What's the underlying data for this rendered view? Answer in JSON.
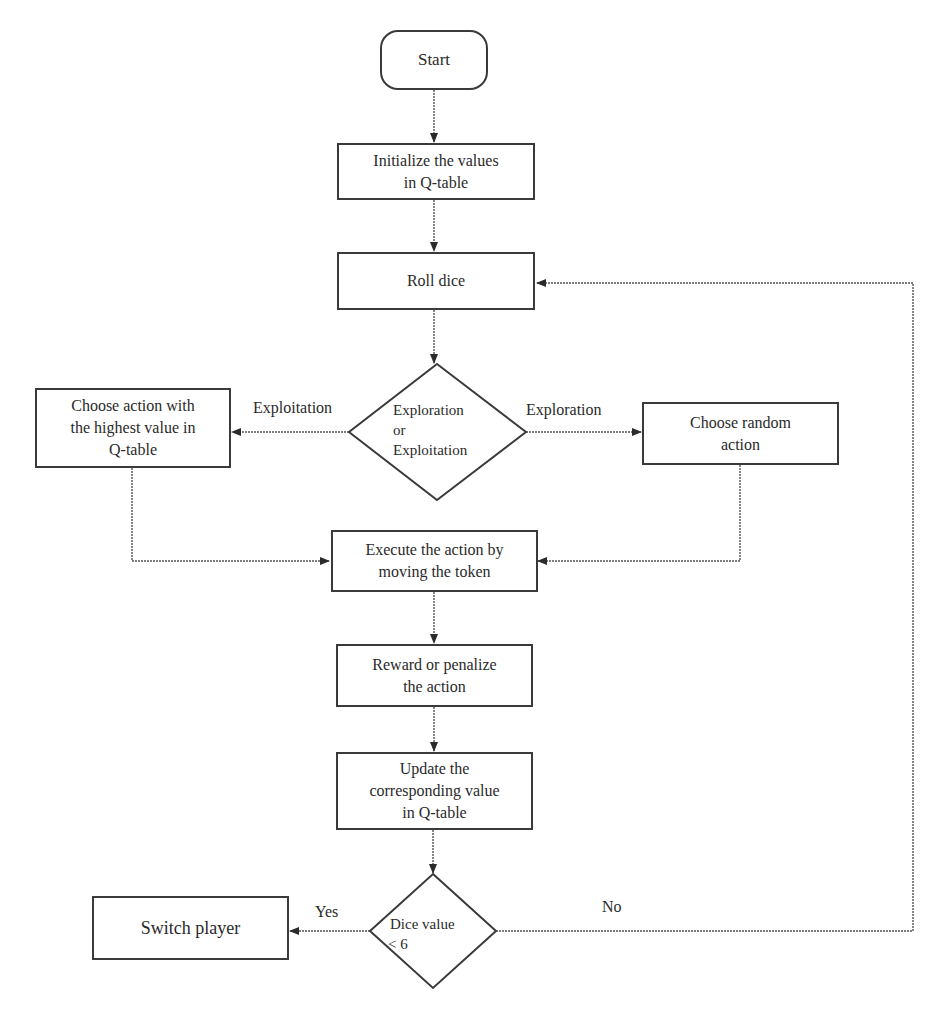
{
  "diagram": {
    "type": "flowchart",
    "nodes": {
      "start": {
        "label": "Start",
        "shape": "terminal"
      },
      "init": {
        "line1": "Initialize  the values",
        "line2": "in Q-table",
        "shape": "process"
      },
      "roll": {
        "label": "Roll dice",
        "shape": "process"
      },
      "decide_explore": {
        "line1": "Exploration",
        "line2": "or",
        "line3": "Exploitation",
        "shape": "decision"
      },
      "exploit_action": {
        "line1": "Choose action with",
        "line2": "the highest value in",
        "line3": "Q-table",
        "shape": "process"
      },
      "random_action": {
        "line1": "Choose random",
        "line2": "action",
        "shape": "process"
      },
      "execute": {
        "line1": "Execute the action by",
        "line2": "moving the token",
        "shape": "process"
      },
      "reward": {
        "line1": "Reward or penalize",
        "line2": "the action",
        "shape": "process"
      },
      "update": {
        "line1": "Update the",
        "line2": "corresponding value",
        "line3": "in Q-table",
        "shape": "process"
      },
      "dice_check": {
        "line1": "Dice value",
        "line2": "< 6",
        "shape": "decision"
      },
      "switch": {
        "label": "Switch player",
        "shape": "process"
      }
    },
    "edge_labels": {
      "exploitation": "Exploitation",
      "exploration": "Exploration",
      "yes": "Yes",
      "no": "No"
    },
    "edges": [
      {
        "from": "start",
        "to": "init"
      },
      {
        "from": "init",
        "to": "roll"
      },
      {
        "from": "roll",
        "to": "decide_explore"
      },
      {
        "from": "decide_explore",
        "to": "exploit_action",
        "label": "Exploitation"
      },
      {
        "from": "decide_explore",
        "to": "random_action",
        "label": "Exploration"
      },
      {
        "from": "exploit_action",
        "to": "execute"
      },
      {
        "from": "random_action",
        "to": "execute"
      },
      {
        "from": "execute",
        "to": "reward"
      },
      {
        "from": "reward",
        "to": "update"
      },
      {
        "from": "update",
        "to": "dice_check"
      },
      {
        "from": "dice_check",
        "to": "switch",
        "label": "Yes"
      },
      {
        "from": "dice_check",
        "to": "roll",
        "label": "No"
      }
    ],
    "colors": {
      "stroke": "#3a3a3a",
      "text": "#2a2a2a",
      "background": "#ffffff"
    }
  }
}
